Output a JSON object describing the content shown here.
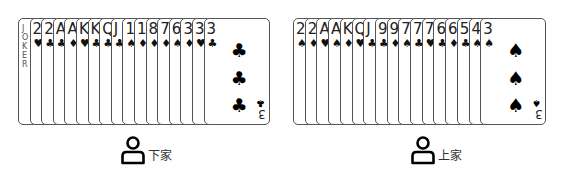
{
  "hands": [
    {
      "name": "left",
      "player_label": "下家",
      "cards": [
        {
          "rank": "JOKER",
          "suit": ""
        },
        {
          "rank": "2",
          "suit": "♥"
        },
        {
          "rank": "2",
          "suit": "♣"
        },
        {
          "rank": "A",
          "suit": "♣"
        },
        {
          "rank": "A",
          "suit": "♦"
        },
        {
          "rank": "K",
          "suit": "♥"
        },
        {
          "rank": "K",
          "suit": "♣"
        },
        {
          "rank": "Q",
          "suit": "♣"
        },
        {
          "rank": "J",
          "suit": "♣"
        },
        {
          "rank": "10",
          "suit": "♠"
        },
        {
          "rank": "10",
          "suit": "♦"
        },
        {
          "rank": "8",
          "suit": "♦"
        },
        {
          "rank": "7",
          "suit": "♦"
        },
        {
          "rank": "6",
          "suit": "♠"
        },
        {
          "rank": "3",
          "suit": "♦"
        },
        {
          "rank": "3",
          "suit": "♥"
        },
        {
          "rank": "3",
          "suit": "♣"
        }
      ]
    },
    {
      "name": "right",
      "player_label": "上家",
      "cards": [
        {
          "rank": "2",
          "suit": "♠"
        },
        {
          "rank": "2",
          "suit": "♦"
        },
        {
          "rank": "A",
          "suit": "♥"
        },
        {
          "rank": "A",
          "suit": "♠"
        },
        {
          "rank": "K",
          "suit": "♦"
        },
        {
          "rank": "Q",
          "suit": "♥"
        },
        {
          "rank": "J",
          "suit": "♣"
        },
        {
          "rank": "9",
          "suit": "♣"
        },
        {
          "rank": "9",
          "suit": "♦"
        },
        {
          "rank": "7",
          "suit": "♠"
        },
        {
          "rank": "7",
          "suit": "♣"
        },
        {
          "rank": "7",
          "suit": "♥"
        },
        {
          "rank": "6",
          "suit": "♣"
        },
        {
          "rank": "6",
          "suit": "♦"
        },
        {
          "rank": "5",
          "suit": "♣"
        },
        {
          "rank": "4",
          "suit": "♠"
        },
        {
          "rank": "3",
          "suit": "♠"
        }
      ]
    }
  ]
}
